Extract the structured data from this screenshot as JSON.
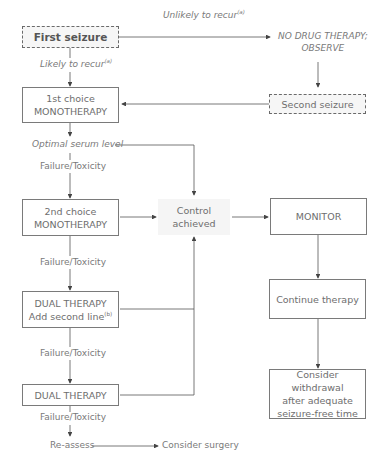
{
  "nodes": {
    "first_seizure": "First seizure",
    "no_drug_therapy_line1": "NO DRUG THERAPY;",
    "no_drug_therapy_line2": "OBSERVE",
    "second_seizure": "Second seizure",
    "first_choice_line1": "1st choice",
    "first_choice_line2": "MONOTHERAPY",
    "second_choice_line1": "2nd choice",
    "second_choice_line2": "MONOTHERAPY",
    "dual_therapy_add_line1": "DUAL THERAPY",
    "dual_therapy_add_line2": "Add second line",
    "dual_therapy_add_sup": "(b)",
    "dual_therapy": "DUAL THERAPY",
    "control_line1": "Control",
    "control_line2": "achieved",
    "monitor": "MONITOR",
    "continue_therapy": "Continue therapy",
    "consider_withdrawal_line1": "Consider withdrawal",
    "consider_withdrawal_line2": "after adequate",
    "consider_withdrawal_line3": "seizure-free time",
    "reassess": "Re-assess",
    "consider_surgery": "Consider surgery"
  },
  "edge_labels": {
    "unlikely_to_recur": "Unlikely to recur",
    "unlikely_sup": "(a)",
    "likely_to_recur": "Likely to recur",
    "likely_sup": "(a)",
    "optimal_serum_level": "Optimal serum level",
    "failure_toxicity_1": "Failure/Toxicity",
    "failure_toxicity_2": "Failure/Toxicity",
    "failure_toxicity_3": "Failure/Toxicity",
    "failure_toxicity_4": "Failure/Toxicity"
  }
}
